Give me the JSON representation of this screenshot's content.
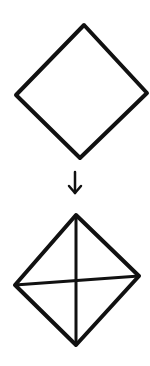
{
  "diagram": {
    "stroke_color": "#111111",
    "background": "#ffffff",
    "steps": [
      {
        "id": "step-1",
        "shape": "diamond",
        "vertices": {
          "top": [
            84,
            25
          ],
          "right": [
            147,
            93
          ],
          "bottom": [
            80,
            158
          ],
          "left": [
            16,
            95
          ]
        },
        "diagonals": false
      },
      {
        "id": "arrow",
        "shape": "arrow-down",
        "from": [
          75,
          172
        ],
        "to": [
          75,
          193
        ]
      },
      {
        "id": "step-2",
        "shape": "diamond",
        "vertices": {
          "top": [
            76,
            215
          ],
          "right": [
            139,
            276
          ],
          "bottom": [
            76,
            345
          ],
          "left": [
            15,
            285
          ]
        },
        "diagonals": true
      }
    ]
  }
}
